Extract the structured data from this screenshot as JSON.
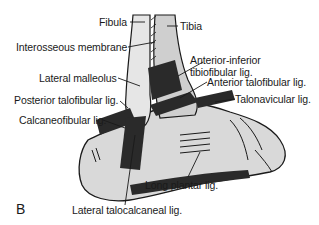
{
  "figure": {
    "panel_letter": "B",
    "labels": {
      "fibula": "Fibula",
      "tibia": "Tibia",
      "interosseous_membrane": "Interosseous membrane",
      "anterior_inferior_tibiofibular_1": "Anterior-inferior",
      "anterior_inferior_tibiofibular_2": "tibiofibular lig.",
      "lateral_malleolus": "Lateral malleolus",
      "anterior_talofibular": "Anterior talofibular lig.",
      "posterior_talofibular": "Posterior talofibular lig.",
      "talonavicular": "Talonavicular lig.",
      "calcaneofibular": "Calcaneofibular lig.",
      "long_plantar": "Long plantar lig.",
      "lateral_talocalcaneal": "Lateral talocalcaneal lig."
    },
    "colors": {
      "line": "#1a1a1a",
      "bone_fill": "#d9d9d9",
      "ligament": "#2a2a2a"
    }
  }
}
